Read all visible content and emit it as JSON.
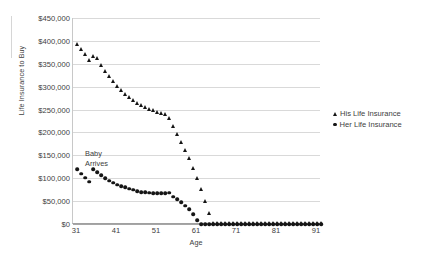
{
  "chart_data": {
    "type": "scatter",
    "title": "",
    "xlabel": "Age",
    "ylabel": "Life Insurance to Buy",
    "xlim": [
      30,
      92
    ],
    "ylim": [
      0,
      450000
    ],
    "grid": true,
    "legend_position": "right",
    "x_ticks": [
      31,
      41,
      51,
      61,
      71,
      81,
      91
    ],
    "x_tick_labels": [
      "31",
      "41",
      "51",
      "61",
      "71",
      "81",
      "91"
    ],
    "y_ticks": [
      0,
      50000,
      100000,
      150000,
      200000,
      250000,
      300000,
      350000,
      400000,
      450000
    ],
    "y_tick_labels": [
      "$0",
      "$50,000",
      "$100,000",
      "$150,000",
      "$200,000",
      "$250,000",
      "$300,000",
      "$350,000",
      "$400,000",
      "$450,000"
    ],
    "annotations": [
      {
        "text": "Baby\nArrives",
        "x": 35,
        "y": 150000
      }
    ],
    "series": [
      {
        "name": "His Life Insurance",
        "marker": "triangle",
        "color": "#151515",
        "x": [
          31,
          32,
          33,
          34,
          35,
          36,
          37,
          38,
          39,
          40,
          41,
          42,
          43,
          44,
          45,
          46,
          47,
          48,
          49,
          50,
          51,
          52,
          53,
          54,
          55,
          56,
          57,
          58,
          59,
          60,
          61,
          62,
          63,
          64,
          65,
          66,
          67,
          68,
          69,
          70,
          71,
          72,
          73,
          74,
          75,
          76,
          77,
          78,
          79,
          80,
          81,
          82,
          83,
          84,
          85,
          86,
          87,
          88,
          89,
          90,
          91,
          92
        ],
        "y": [
          392000,
          382000,
          370000,
          358000,
          365000,
          362000,
          345000,
          333000,
          322000,
          310000,
          300000,
          292000,
          283000,
          276000,
          270000,
          263000,
          258000,
          254000,
          250000,
          247000,
          244000,
          241000,
          238000,
          230000,
          212000,
          196000,
          178000,
          160000,
          142000,
          122000,
          100000,
          76000,
          48000,
          22000,
          0,
          0,
          0,
          0,
          0,
          0,
          0,
          0,
          0,
          0,
          0,
          0,
          0,
          0,
          0,
          0,
          0,
          0,
          0,
          0,
          0,
          0,
          0,
          0,
          0,
          0,
          0,
          0
        ]
      },
      {
        "name": "Her Life Insurance",
        "marker": "circle",
        "color": "#151515",
        "x": [
          31,
          32,
          33,
          34,
          35,
          36,
          37,
          38,
          39,
          40,
          41,
          42,
          43,
          44,
          45,
          46,
          47,
          48,
          49,
          50,
          51,
          52,
          53,
          54,
          55,
          56,
          57,
          58,
          59,
          60,
          61,
          62,
          63,
          64,
          65,
          66,
          67,
          68,
          69,
          70,
          71,
          72,
          73,
          74,
          75,
          76,
          77,
          78,
          79,
          80,
          81,
          82,
          83,
          84,
          85,
          86,
          87,
          88,
          89,
          90,
          91,
          92
        ],
        "y": [
          120000,
          110000,
          101000,
          92000,
          120000,
          113000,
          106000,
          100000,
          95000,
          90000,
          86000,
          83000,
          80000,
          77000,
          75000,
          72000,
          70000,
          69000,
          68000,
          67000,
          67000,
          67000,
          67000,
          68000,
          60000,
          54000,
          47000,
          40000,
          32000,
          22000,
          8000,
          0,
          0,
          0,
          0,
          0,
          0,
          0,
          0,
          0,
          0,
          0,
          0,
          0,
          0,
          0,
          0,
          0,
          0,
          0,
          0,
          0,
          0,
          0,
          0,
          0,
          0,
          0,
          0,
          0,
          0,
          0
        ]
      }
    ]
  },
  "legend": {
    "items": [
      {
        "label": "His Life Insurance",
        "marker": "triangle"
      },
      {
        "label": "Her Life Insurance",
        "marker": "circle"
      }
    ]
  }
}
